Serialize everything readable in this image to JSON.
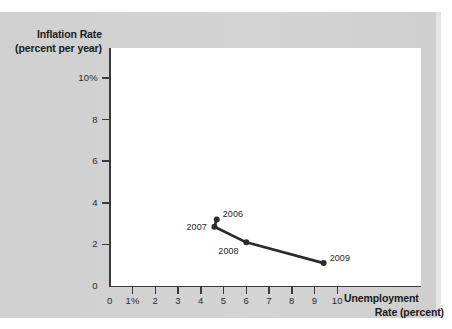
{
  "chart_data": {
    "type": "line",
    "title": "",
    "xlabel": "Unemployment Rate (percent)",
    "ylabel": "Inflation Rate (percent per year)",
    "xlabel_line1": "Unemployment",
    "xlabel_line2": "Rate (percent)",
    "ylabel_line1": "Inflation Rate",
    "ylabel_line2": "(percent per year)",
    "xlim": [
      0,
      10.6
    ],
    "ylim": [
      0,
      11.2
    ],
    "grid": false,
    "legend": "none",
    "x_ticks": [
      {
        "value": 0,
        "label": "0"
      },
      {
        "value": 1,
        "label": "1%"
      },
      {
        "value": 2,
        "label": "2"
      },
      {
        "value": 3,
        "label": "3"
      },
      {
        "value": 4,
        "label": "4"
      },
      {
        "value": 5,
        "label": "5"
      },
      {
        "value": 6,
        "label": "6"
      },
      {
        "value": 7,
        "label": "7"
      },
      {
        "value": 8,
        "label": "8"
      },
      {
        "value": 9,
        "label": "9"
      },
      {
        "value": 10,
        "label": "10"
      }
    ],
    "y_ticks": [
      {
        "value": 0,
        "label": "0"
      },
      {
        "value": 2,
        "label": "2"
      },
      {
        "value": 4,
        "label": "4"
      },
      {
        "value": 6,
        "label": "6"
      },
      {
        "value": 8,
        "label": "8"
      },
      {
        "value": 10,
        "label": "10%"
      }
    ],
    "series": [
      {
        "name": "Phillips curve path",
        "color": "#2b2b2b",
        "points": [
          {
            "label": "2006",
            "x": 4.7,
            "y": 3.2,
            "label_pos": "right"
          },
          {
            "label": "2007",
            "x": 4.6,
            "y": 2.85,
            "label_pos": "left"
          },
          {
            "label": "2008",
            "x": 6.0,
            "y": 2.1,
            "label_pos": "below-left"
          },
          {
            "label": "2009",
            "x": 9.4,
            "y": 1.1,
            "label_pos": "right"
          }
        ]
      }
    ]
  },
  "colors": {
    "panel_background": "#d2d2d2",
    "plot_background": "#ffffff",
    "axis": "#3a3a3a",
    "series": "#2b2b2b",
    "text": "#1a1a1a"
  }
}
